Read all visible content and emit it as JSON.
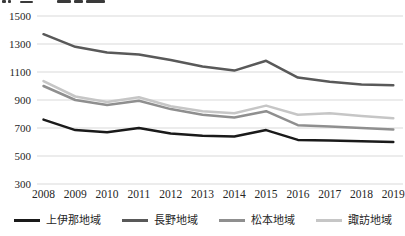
{
  "chart_data": {
    "type": "line",
    "title": "",
    "xlabel": "",
    "ylabel": "",
    "categories": [
      "2008",
      "2009",
      "2010",
      "2011",
      "2012",
      "2013",
      "2014",
      "2015",
      "2016",
      "2017",
      "2018",
      "2019"
    ],
    "series": [
      {
        "id": "kamiina",
        "name": "上伊那地域",
        "color": "#1a1a1a",
        "values": [
          760,
          685,
          670,
          700,
          660,
          645,
          640,
          685,
          615,
          610,
          605,
          600
        ]
      },
      {
        "id": "nagano",
        "name": "長野地域",
        "color": "#595959",
        "values": [
          1370,
          1280,
          1240,
          1225,
          1185,
          1140,
          1110,
          1180,
          1060,
          1030,
          1010,
          1005
        ]
      },
      {
        "id": "matsumoto",
        "name": "松本地域",
        "color": "#8f8f8f",
        "values": [
          1000,
          900,
          865,
          895,
          835,
          795,
          775,
          820,
          720,
          710,
          700,
          690
        ]
      },
      {
        "id": "suwa",
        "name": "諏訪地域",
        "color": "#c6c6c6",
        "values": [
          1035,
          925,
          885,
          920,
          855,
          820,
          805,
          860,
          795,
          805,
          785,
          770
        ]
      }
    ],
    "ylim": [
      300,
      1500
    ],
    "ytick_step": 200,
    "yticks": [
      300,
      500,
      700,
      900,
      1100,
      1300,
      1500
    ],
    "grid": "horizontal",
    "gridline_color": "#d9d9d9",
    "tick_label_color": "#262626",
    "legend_position": "bottom"
  }
}
